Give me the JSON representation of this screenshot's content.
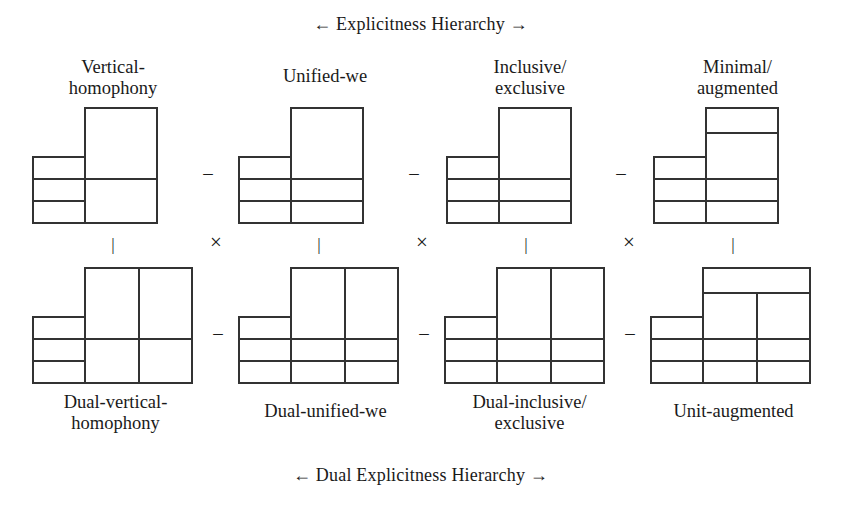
{
  "figure": {
    "top_header": "← Explicitness Hierarchy →",
    "bottom_header": "← Dual Explicitness Hierarchy →",
    "stroke_color": "#333333",
    "text_color": "#1a1a1a",
    "background_color": "#ffffff"
  },
  "operators": {
    "minus": "–",
    "times": "×",
    "tick": "|"
  },
  "top_row": {
    "items": [
      {
        "label": "Vertical-\nhomophony"
      },
      {
        "label": "Unified-we"
      },
      {
        "label": "Inclusive/\nexclusive"
      },
      {
        "label": "Minimal/\naugmented"
      }
    ],
    "separators": [
      "–",
      "–",
      "–"
    ]
  },
  "bottom_row": {
    "items": [
      {
        "label": "Dual-vertical-\nhomophony"
      },
      {
        "label": "Dual-unified-we"
      },
      {
        "label": "Dual-inclusive/\nexclusive"
      },
      {
        "label": "Unit-augmented"
      }
    ],
    "separators": [
      "–",
      "–",
      "–"
    ]
  },
  "column_links": {
    "ticks": [
      "|",
      "|",
      "|",
      "|"
    ],
    "multipliers": [
      "×",
      "×",
      "×"
    ]
  }
}
